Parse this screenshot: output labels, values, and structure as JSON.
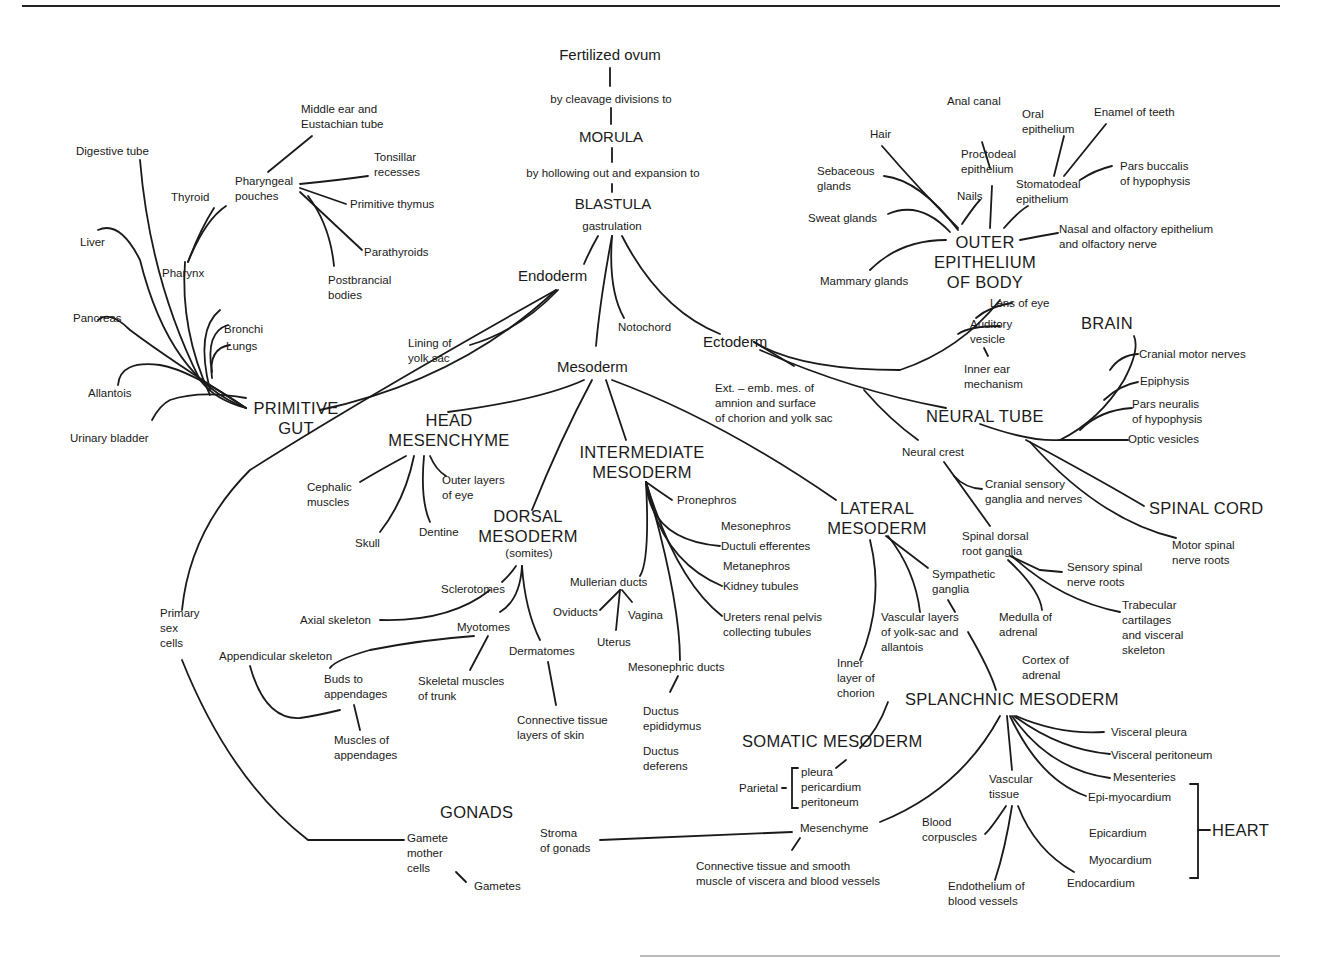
{
  "diagram": {
    "root": {
      "fertilized_ovum": "Fertilized ovum",
      "step1": "by cleavage divisions to",
      "morula": "MORULA",
      "step2": "by hollowing out and expansion to",
      "blastula": "BLASTULA",
      "gastrulation": "gastrulation"
    },
    "germ_layers": {
      "endoderm": "Endoderm",
      "mesoderm": "Mesoderm",
      "ectoderm": "Ectoderm",
      "notochord": "Notochord"
    },
    "endoderm": {
      "lining_yolk_sac": "Lining of\nyolk sac",
      "primitive_gut": "PRIMITIVE\nGUT",
      "digestive_tube": "Digestive tube",
      "liver": "Liver",
      "pancreas": "Pancreas",
      "allantois": "Allantois",
      "urinary_bladder": "Urinary bladder",
      "pharynx": "Pharynx",
      "thyroid": "Thyroid",
      "bronchi": "Bronchi",
      "lungs": "Lungs",
      "pharyngeal_pouches": "Pharyngeal\npouches",
      "middle_ear": "Middle ear and\nEustachian tube",
      "tonsillar": "Tonsillar\nrecesses",
      "primitive_thymus": "Primitive thymus",
      "parathyroids": "Parathyroids",
      "postbrancial": "Postbrancial\nbodies"
    },
    "ectoderm": {
      "outer_epithelium": "OUTER\nEPITHELIUM\nOF BODY",
      "anal_canal": "Anal canal",
      "hair": "Hair",
      "proctodeal": "Proctodeal\nepithelium",
      "oral_epithelium": "Oral\nepithelium",
      "enamel": "Enamel of teeth",
      "sebaceous": "Sebaceous\nglands",
      "nails": "Nails",
      "stomatodeal": "Stomatodeal\nepithelium",
      "pars_buccalis": "Pars buccalis\nof hypophysis",
      "sweat_glands": "Sweat glands",
      "nasal": "Nasal and olfactory epithelium\nand olfactory nerve",
      "mammary": "Mammary glands",
      "lens": "Lens of eye",
      "auditory": "Auditory\nvesicle",
      "inner_ear": "Inner ear\nmechanism",
      "ext_emb": "Ext. – emb. mes. of\namnion and surface\nof chorion and yolk sac",
      "neural_tube": "NEURAL TUBE",
      "brain": "BRAIN",
      "cranial_motor": "Cranial motor nerves",
      "epiphysis": "Epiphysis",
      "pars_neuralis": "Pars neuralis\nof hypophysis",
      "optic": "Optic vesicles",
      "spinal_cord": "SPINAL CORD",
      "motor_spinal": "Motor spinal\nnerve roots",
      "neural_crest": "Neural crest",
      "cranial_sensory": "Cranial sensory\nganglia and nerves",
      "spinal_dorsal": "Spinal dorsal\nroot ganglia",
      "sensory_spinal": "Sensory spinal\nnerve roots",
      "trabecular": "Trabecular\ncartilages\nand visceral\nskeleton",
      "sympathetic": "Sympathetic\nganglia",
      "medulla_adrenal": "Medulla of\nadrenal"
    },
    "mesoderm": {
      "head_mesenchyme": "HEAD\nMESENCHYME",
      "cephalic": "Cephalic\nmuscles",
      "outer_layers_eye": "Outer layers\nof eye",
      "skull": "Skull",
      "dentine": "Dentine",
      "dorsal": "DORSAL\nMESODERM",
      "somites": "(somites)",
      "sclerotomes": "Sclerotomes",
      "axial": "Axial skeleton",
      "myotomes": "Myotomes",
      "appendicular": "Appendicular skeleton",
      "buds": "Buds to\nappendages",
      "skeletal_trunk": "Skeletal muscles\nof trunk",
      "dermatomes": "Dermatomes",
      "muscles_app": "Muscles of\nappendages",
      "conn_skin": "Connective tissue\nlayers of skin",
      "intermediate": "INTERMEDIATE\nMESODERM",
      "pronephros": "Pronephros",
      "mesonephros": "Mesonephros",
      "ductuli": "Ductuli efferentes",
      "metanephros": "Metanephros",
      "kidney": "Kidney tubules",
      "mullerian": "Mullerian ducts",
      "oviducts": "Oviducts",
      "vagina": "Vagina",
      "uterus": "Uterus",
      "ureters": "Ureters renal pelvis\ncollecting tubules",
      "mesonephric": "Mesonephric ducts",
      "epididymus": "Ductus\nepididymus",
      "deferens": "Ductus\ndeferens",
      "lateral": "LATERAL\nMESODERM",
      "vascular_layers": "Vascular layers\nof yolk-sac and\nallantois",
      "inner_chorion": "Inner\nlayer of\nchorion",
      "cortex_adrenal": "Cortex of\nadrenal",
      "somatic": "SOMATIC MESODERM",
      "parietal": "Parietal",
      "parietal_items": "pleura\npericardium\nperitoneum",
      "splanchnic": "SPLANCHNIC MESODERM",
      "visceral_pleura": "Visceral pleura",
      "visceral_peritoneum": "Visceral peritoneum",
      "mesenteries": "Mesenteries",
      "epi_myocardium": "Epi-myocardium",
      "epicardium": "Epicardium",
      "myocardium": "Myocardium",
      "endocardium": "Endocardium",
      "heart": "HEART",
      "vascular_tissue": "Vascular\ntissue",
      "blood_corpuscles": "Blood\ncorpuscles",
      "endothelium": "Endothelium of\nblood vessels",
      "mesenchyme": "Mesenchyme",
      "conn_smooth": "Connective tissue and smooth\nmuscle of viscera and blood vessels",
      "stroma": "Stroma\nof gonads",
      "gonads": "GONADS",
      "primary_sex": "Primary\nsex\ncells",
      "gamete_mother": "Gamete\nmother\ncells",
      "gametes": "Gametes"
    }
  }
}
